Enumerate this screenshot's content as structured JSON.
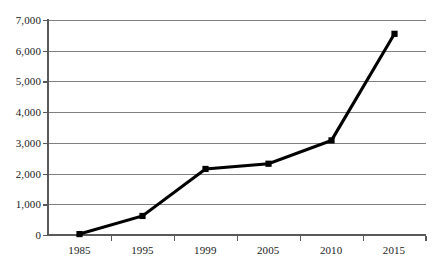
{
  "chart_data": {
    "type": "line",
    "title": "",
    "subtitle": "",
    "xlabel": "",
    "ylabel": "",
    "categories": [
      "1985",
      "1995",
      "1999",
      "2005",
      "2010",
      "2015"
    ],
    "values": [
      30,
      620,
      2150,
      2320,
      3080,
      6550
    ],
    "series": [
      {
        "name": "",
        "values": [
          30,
          620,
          2150,
          2320,
          3080,
          6550
        ]
      }
    ],
    "ylim": [
      0,
      7000
    ],
    "y_ticks": [
      0,
      1000,
      2000,
      3000,
      4000,
      5000,
      6000,
      7000
    ],
    "y_tick_labels": [
      "0",
      "1,000",
      "2,000",
      "3,000",
      "4,000",
      "5,000",
      "6,000",
      "7,000"
    ],
    "x_tick_labels": [
      "1985",
      "1995",
      "1999",
      "2005",
      "2010",
      "2015"
    ],
    "grid": "horizontal",
    "legend": "none",
    "marker": "square",
    "line_color": "#000000",
    "marker_color": "#000000",
    "grid_color": "#808080",
    "axis_color": "#595959",
    "background_color": "#ffffff"
  },
  "axes": {
    "y_labels": [
      "7,000",
      "6,000",
      "5,000",
      "4,000",
      "3,000",
      "2,000",
      "1,000",
      "0"
    ],
    "x_labels": [
      "1985",
      "1995",
      "1999",
      "2005",
      "2010",
      "2015"
    ]
  }
}
